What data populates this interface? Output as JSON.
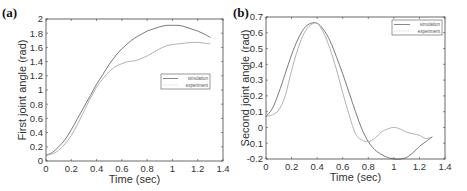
{
  "figure": {
    "panels": [
      {
        "label": "(a)",
        "xlabel": "Time (sec)",
        "ylabel": "First joint angle (rad)"
      },
      {
        "label": "(b)",
        "xlabel": "Time (sec)",
        "ylabel": "Second joint angle (rad)"
      }
    ],
    "legend": {
      "simulation": "simulation",
      "experiment": "experiment"
    }
  },
  "colors": {
    "simulation": "#6a6a6a",
    "experiment": "#a8a8a8",
    "axis": "#444444"
  },
  "chart_data": [
    {
      "type": "line",
      "title": "(a)",
      "xlabel": "Time (sec)",
      "ylabel": "First joint angle (rad)",
      "xlim": [
        0,
        1.4
      ],
      "ylim": [
        0,
        2
      ],
      "xticks": [
        0,
        0.2,
        0.4,
        0.6,
        0.8,
        1,
        1.2,
        1.4
      ],
      "xtick_labels": [
        "0",
        "0.2",
        "0.4",
        "0.6",
        "0.8",
        "1",
        "1.2",
        "1.4"
      ],
      "yticks": [
        0,
        0.2,
        0.4,
        0.6,
        0.8,
        1,
        1.2,
        1.4,
        1.6,
        1.8,
        2
      ],
      "ytick_labels": [
        "0",
        "0.2",
        "0.4",
        "0.6",
        "0.8",
        "1",
        "1.2",
        "1.4",
        "1.6",
        "1.8",
        "2"
      ],
      "grid": false,
      "legend_position": "center-right",
      "series": [
        {
          "name": "simulation",
          "x": [
            0,
            0.05,
            0.1,
            0.15,
            0.2,
            0.25,
            0.3,
            0.35,
            0.4,
            0.45,
            0.5,
            0.55,
            0.6,
            0.65,
            0.7,
            0.75,
            0.8,
            0.85,
            0.9,
            0.95,
            1.0,
            1.05,
            1.1,
            1.15,
            1.2,
            1.25,
            1.3
          ],
          "values": [
            0.08,
            0.12,
            0.2,
            0.3,
            0.44,
            0.6,
            0.76,
            0.92,
            1.08,
            1.22,
            1.36,
            1.48,
            1.58,
            1.66,
            1.73,
            1.78,
            1.83,
            1.86,
            1.89,
            1.91,
            1.91,
            1.91,
            1.89,
            1.86,
            1.83,
            1.79,
            1.74
          ]
        },
        {
          "name": "experiment",
          "x": [
            0,
            0.05,
            0.1,
            0.15,
            0.2,
            0.25,
            0.3,
            0.35,
            0.4,
            0.45,
            0.5,
            0.55,
            0.6,
            0.65,
            0.7,
            0.75,
            0.8,
            0.85,
            0.9,
            0.95,
            1.0,
            1.05,
            1.1,
            1.15,
            1.2,
            1.25,
            1.3
          ],
          "values": [
            0.08,
            0.1,
            0.15,
            0.24,
            0.36,
            0.52,
            0.7,
            0.88,
            1.04,
            1.16,
            1.26,
            1.33,
            1.37,
            1.4,
            1.41,
            1.44,
            1.48,
            1.53,
            1.58,
            1.62,
            1.64,
            1.65,
            1.66,
            1.67,
            1.67,
            1.66,
            1.65
          ]
        }
      ]
    },
    {
      "type": "line",
      "title": "(b)",
      "xlabel": "Time (sec)",
      "ylabel": "Second joint angle (rad)",
      "xlim": [
        0,
        1.4
      ],
      "ylim": [
        -0.2,
        0.7
      ],
      "xticks": [
        0,
        0.2,
        0.4,
        0.6,
        0.8,
        1,
        1.2,
        1.4
      ],
      "xtick_labels": [
        "0",
        "0.2",
        "0.4",
        "0.6",
        "0.8",
        "1",
        "1.2",
        "1.4"
      ],
      "yticks": [
        -0.2,
        -0.1,
        0,
        0.1,
        0.2,
        0.3,
        0.4,
        0.5,
        0.6,
        0.7
      ],
      "ytick_labels": [
        "-0.2",
        "-0.1",
        "0",
        "0.1",
        "0.2",
        "0.3",
        "0.4",
        "0.5",
        "0.6",
        "0.7"
      ],
      "grid": false,
      "legend_position": "upper-right",
      "series": [
        {
          "name": "simulation",
          "x": [
            0,
            0.05,
            0.1,
            0.15,
            0.2,
            0.25,
            0.3,
            0.35,
            0.4,
            0.45,
            0.5,
            0.55,
            0.6,
            0.65,
            0.7,
            0.75,
            0.8,
            0.85,
            0.9,
            0.95,
            1.0,
            1.05,
            1.1,
            1.15,
            1.2,
            1.25,
            1.3
          ],
          "values": [
            0.07,
            0.12,
            0.22,
            0.34,
            0.46,
            0.56,
            0.63,
            0.66,
            0.66,
            0.62,
            0.55,
            0.45,
            0.34,
            0.22,
            0.1,
            -0.01,
            -0.09,
            -0.14,
            -0.17,
            -0.19,
            -0.2,
            -0.2,
            -0.19,
            -0.16,
            -0.12,
            -0.09,
            -0.06
          ]
        },
        {
          "name": "experiment",
          "x": [
            0,
            0.05,
            0.1,
            0.15,
            0.2,
            0.25,
            0.3,
            0.35,
            0.4,
            0.45,
            0.5,
            0.55,
            0.6,
            0.65,
            0.7,
            0.75,
            0.8,
            0.85,
            0.9,
            0.95,
            1.0,
            1.05,
            1.1,
            1.15,
            1.2,
            1.25,
            1.3
          ],
          "values": [
            0.07,
            0.08,
            0.11,
            0.2,
            0.36,
            0.5,
            0.6,
            0.65,
            0.66,
            0.6,
            0.5,
            0.37,
            0.22,
            0.08,
            -0.04,
            -0.08,
            -0.09,
            -0.07,
            -0.03,
            -0.01,
            0.0,
            -0.01,
            -0.03,
            -0.04,
            -0.05,
            -0.07,
            -0.06
          ]
        }
      ]
    }
  ]
}
